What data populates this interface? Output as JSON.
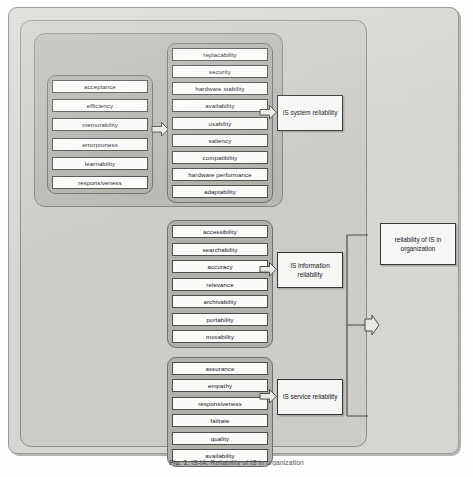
{
  "figure": {
    "caption_label": "Fig. 1.",
    "caption_text": "IS-IA. Reliability of IS in organization"
  },
  "groups": {
    "usability": {
      "name": "usability dimension",
      "items": [
        "acceptance",
        "efficiency",
        "memorability",
        "errorproness",
        "learnability",
        "responsiveness"
      ]
    },
    "system": {
      "name": "IS system dimension",
      "items": [
        "replacability",
        "security",
        "hardware stability",
        "availability",
        "usability",
        "saliency",
        "compatibility",
        "hardware performance",
        "adaptability"
      ]
    },
    "information": {
      "name": "IS information dimension",
      "items": [
        "accessibility",
        "searchability",
        "accuracy",
        "relevance",
        "archivability",
        "portability",
        "movability"
      ]
    },
    "service": {
      "name": "IS service dimension",
      "items": [
        "assurance",
        "empathy",
        "responsiveness",
        "failrate",
        "quality",
        "availability"
      ]
    }
  },
  "outcomes": {
    "system": "IS system reliability",
    "information": "IS information reliability",
    "service": "IS service reliability",
    "final": "reliability of IS in organization"
  },
  "arrows": {
    "usability_to_system": "arrow-right",
    "system_to_outcome": "arrow-right",
    "information_to_outcome": "arrow-right",
    "service_to_outcome": "arrow-right",
    "outcomes_to_final": "arrow-right"
  },
  "colors": {
    "panel_background": "#d7d6d2",
    "frame_background": "#cdccc8",
    "section_background": "#b9b8b4",
    "group_background": "#b1b0ab",
    "item_background": "#fbfbfa",
    "box_border": "#35353a",
    "arrow_fill": "#e9e9e6"
  }
}
